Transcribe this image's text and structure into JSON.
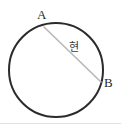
{
  "figure": {
    "background_color": "#ffffff",
    "width": 121,
    "height": 126,
    "circle": {
      "name": "circle-outline",
      "center_x": 56,
      "center_y": 70,
      "radius": 47,
      "stroke_color": "#2b2b2b",
      "stroke_width": 2,
      "fill": "none"
    },
    "chord": {
      "name": "chord-segment-AB",
      "x1": 44,
      "y1": 27,
      "x2": 101,
      "y2": 82,
      "stroke_color": "#b8b8b8",
      "stroke_width": 1.6
    },
    "baseline": {
      "name": "bottom-rule",
      "color": "#e2e2e2"
    }
  },
  "labels": {
    "point_a": "A",
    "point_b": "B",
    "chord": "현"
  }
}
